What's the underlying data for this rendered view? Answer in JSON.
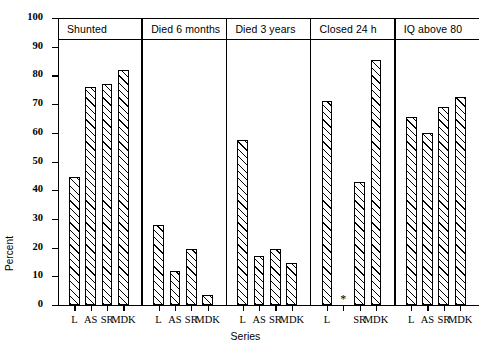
{
  "chart_data": {
    "type": "bar",
    "title": "",
    "xlabel": "Series",
    "ylabel": "Percent",
    "ylim": [
      0,
      100
    ],
    "ytick_labels": [
      "0",
      "10",
      "20",
      "30",
      "40",
      "50",
      "60",
      "70",
      "80",
      "90",
      "100"
    ],
    "ytick_values": [
      0,
      10,
      20,
      30,
      40,
      50,
      60,
      70,
      80,
      90,
      100
    ],
    "grid": false,
    "legend": "none",
    "categories": [
      "L",
      "AS",
      "SR",
      "MDK"
    ],
    "panels": [
      {
        "title": "Shunted",
        "categories": [
          "L",
          "AS",
          "SR",
          "MDK"
        ],
        "values": [
          44.5,
          76,
          77,
          82
        ],
        "notes": []
      },
      {
        "title": "Died 6 months",
        "categories": [
          "L",
          "AS",
          "SR",
          "MDK"
        ],
        "values": [
          28,
          12,
          19.5,
          3.5
        ],
        "notes": []
      },
      {
        "title": "Died 3 years",
        "categories": [
          "L",
          "AS",
          "SR",
          "MDK"
        ],
        "values": [
          57.5,
          17,
          19.5,
          14.5
        ],
        "notes": []
      },
      {
        "title": "Closed 24 h",
        "categories": [
          "L",
          "AS",
          "SR",
          "MDK"
        ],
        "values": [
          71,
          null,
          43,
          85.5
        ],
        "notes": [
          {
            "category": "AS",
            "marker": "*"
          }
        ]
      },
      {
        "title": "IQ above 80",
        "categories": [
          "L",
          "AS",
          "SR",
          "MDK"
        ],
        "values": [
          65.5,
          60,
          69,
          72.5
        ],
        "notes": []
      }
    ]
  },
  "style": {
    "bar_edge_color": "#000000",
    "bar_fill": "hatched-diagonal",
    "axis_color": "#000000",
    "background": "#ffffff"
  }
}
